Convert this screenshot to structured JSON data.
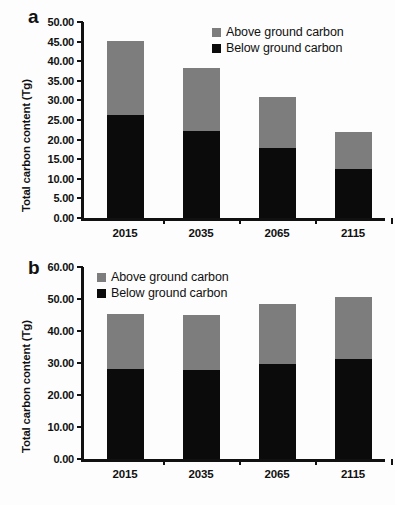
{
  "figure": {
    "background": "#ffffff",
    "colors": {
      "above_ground": "#7d7d7d",
      "below_ground": "#0b0b0b",
      "axis": "#111111"
    }
  },
  "panels": [
    {
      "letter": "a",
      "ylabel": "Total carbon content (Tg)",
      "legend": [
        {
          "label": "Above ground carbon",
          "color": "#7d7d7d"
        },
        {
          "label": "Below ground carbon",
          "color": "#0b0b0b"
        }
      ],
      "yticks": [
        "0.00",
        "5.00",
        "10.00",
        "15.00",
        "20.00",
        "25.00",
        "30.00",
        "35.00",
        "40.00",
        "45.00",
        "50.00"
      ],
      "xticks": [
        "2015",
        "2035",
        "2065",
        "2115"
      ]
    },
    {
      "letter": "b",
      "ylabel": "Total carbon content (Tg)",
      "legend": [
        {
          "label": "Above ground carbon",
          "color": "#7d7d7d"
        },
        {
          "label": "Below ground carbon",
          "color": "#0b0b0b"
        }
      ],
      "yticks": [
        "0.00",
        "10.00",
        "20.00",
        "30.00",
        "40.00",
        "50.00",
        "60.00"
      ],
      "xticks": [
        "2015",
        "2035",
        "2065",
        "2115"
      ]
    }
  ],
  "chart_data": [
    {
      "type": "bar",
      "panel": "a",
      "stacked": true,
      "title": "",
      "xlabel": "",
      "ylabel": "Total carbon content (Tg)",
      "categories": [
        "2015",
        "2035",
        "2065",
        "2115"
      ],
      "series": [
        {
          "name": "Below ground carbon",
          "color": "#0b0b0b",
          "values": [
            26.4,
            22.1,
            17.9,
            12.5
          ]
        },
        {
          "name": "Above ground carbon",
          "color": "#7d7d7d",
          "values": [
            18.8,
            16.2,
            13.1,
            9.5
          ]
        }
      ],
      "totals": [
        45.2,
        38.3,
        31.0,
        22.0
      ],
      "ylim": [
        0,
        50
      ],
      "ytick_step": 5,
      "grid": false,
      "legend_position": "top-right"
    },
    {
      "type": "bar",
      "panel": "b",
      "stacked": true,
      "title": "",
      "xlabel": "",
      "ylabel": "Total carbon content (Tg)",
      "categories": [
        "2015",
        "2035",
        "2065",
        "2115"
      ],
      "series": [
        {
          "name": "Below ground carbon",
          "color": "#0b0b0b",
          "values": [
            28.2,
            27.9,
            29.8,
            31.1
          ]
        },
        {
          "name": "Above ground carbon",
          "color": "#7d7d7d",
          "values": [
            17.1,
            17.2,
            18.7,
            19.6
          ]
        }
      ],
      "totals": [
        45.3,
        45.1,
        48.5,
        50.7
      ],
      "ylim": [
        0,
        60
      ],
      "ytick_step": 10,
      "grid": false,
      "legend_position": "top-left"
    }
  ]
}
